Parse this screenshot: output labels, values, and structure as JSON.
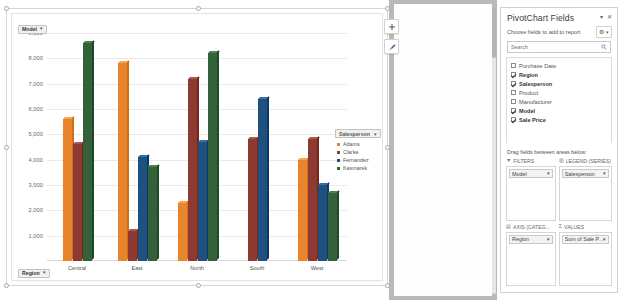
{
  "chart": {
    "filter_model": {
      "label": "Model",
      "caret": "▾"
    },
    "filter_region": {
      "label": "Region",
      "caret": "▾"
    },
    "float_buttons": [
      {
        "name": "chart-elements-button",
        "glyph": "+"
      },
      {
        "name": "chart-styles-button",
        "glyph": "✎"
      }
    ],
    "legend": {
      "title": "Salesperson",
      "caret": "▾",
      "items": [
        "Adams",
        "Clarke",
        "Fernandez",
        "Kasmarek"
      ]
    }
  },
  "chart_data": {
    "type": "bar",
    "title": "",
    "xlabel": "",
    "ylabel": "",
    "ylim": [
      0,
      9000
    ],
    "ytick_step": 1000,
    "yticks": [
      "1,000",
      "2,000",
      "3,000",
      "4,000",
      "5,000",
      "6,000",
      "7,000",
      "8,000",
      "9,000"
    ],
    "grid": true,
    "legend_position": "right",
    "categories": [
      "Central",
      "East",
      "North",
      "South",
      "West"
    ],
    "series": [
      {
        "name": "Adams",
        "color": "#E8842B",
        "values": [
          5600,
          7800,
          2300,
          null,
          4000
        ]
      },
      {
        "name": "Clarke",
        "color": "#8C3A32",
        "values": [
          4600,
          1200,
          7200,
          4800,
          4800
        ]
      },
      {
        "name": "Fernandez",
        "color": "#20507D",
        "values": [
          null,
          4100,
          4700,
          6400,
          3000
        ]
      },
      {
        "name": "Kasmarek",
        "color": "#33623A",
        "values": [
          8600,
          3700,
          8200,
          null,
          2700
        ]
      }
    ]
  },
  "pane": {
    "title": "PivotChart Fields",
    "minimize_glyph": "▾",
    "close_glyph": "✕",
    "subtitle": "Choose fields to add to report",
    "gear_glyph": "⚙",
    "gear_caret": "▾",
    "search": {
      "placeholder": "Search",
      "value": "",
      "icon": "🔍"
    },
    "fields": [
      {
        "label": "Purchase Date",
        "checked": false
      },
      {
        "label": "Region",
        "checked": true
      },
      {
        "label": "Salesperson",
        "checked": true
      },
      {
        "label": "Product",
        "checked": false
      },
      {
        "label": "Manufacturer",
        "checked": false
      },
      {
        "label": "Model",
        "checked": true
      },
      {
        "label": "Sale Price",
        "checked": true
      }
    ],
    "drag_hint": "Drag fields between areas below:",
    "areas": [
      {
        "name": "filters",
        "icon": "▼",
        "label": "FILTERS",
        "pill": "Model",
        "caret": "▾"
      },
      {
        "name": "legend",
        "icon": "▥",
        "label": "LEGEND (SERIES)",
        "pill": "Salesperson",
        "caret": "▾"
      },
      {
        "name": "axis",
        "icon": "▤",
        "label": "AXIS (CATEG...",
        "pill": "Region",
        "caret": "▾"
      },
      {
        "name": "values",
        "icon": "Σ",
        "label": "VALUES",
        "pill": "Sum of Sale P...",
        "caret": "▾"
      }
    ]
  }
}
